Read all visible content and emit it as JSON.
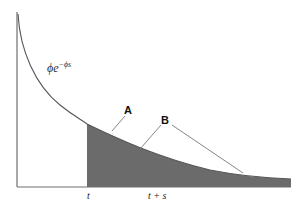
{
  "figure": {
    "type": "diagram",
    "curve_label": {
      "base": "ϕe",
      "exponent": "−ϕs"
    },
    "x_ticks": [
      {
        "label": "t",
        "x": 89
      },
      {
        "label": "t + s",
        "x": 157
      }
    ],
    "annotations": [
      {
        "label": "A",
        "points_to": "curve at t"
      },
      {
        "label": "B",
        "points_to": "curve beyond t (two leader lines)"
      }
    ],
    "colors": {
      "axis": "#6e6e6e",
      "curve": "#555555",
      "fill": "#6b6b6b",
      "leader": "#777777",
      "text": "#222222"
    }
  }
}
